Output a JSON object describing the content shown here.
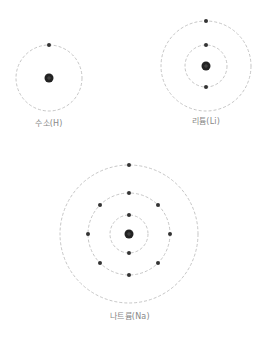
{
  "colors": {
    "orbit": "#b8b8b8",
    "electron": "#333333",
    "nucleus": "#222222",
    "label": "#888888"
  },
  "atoms": [
    {
      "name": "hydrogen",
      "label": "수소(H)",
      "center": [
        49,
        78
      ],
      "shells": [
        {
          "radius": 33,
          "electrons": [
            270
          ]
        }
      ],
      "label_pos": [
        49,
        123
      ]
    },
    {
      "name": "lithium",
      "label": "리튬(Li)",
      "center": [
        206,
        66
      ],
      "shells": [
        {
          "radius": 21,
          "electrons": [
            270,
            90
          ]
        },
        {
          "radius": 45,
          "electrons": [
            270
          ]
        }
      ],
      "label_pos": [
        206,
        121
      ]
    },
    {
      "name": "sodium",
      "label": "나트륨(Na)",
      "center": [
        129,
        234
      ],
      "shells": [
        {
          "radius": 19,
          "electrons": [
            270,
            90
          ]
        },
        {
          "radius": 41,
          "electrons": [
            270,
            315,
            0,
            45,
            90,
            135,
            180,
            225
          ]
        },
        {
          "radius": 69,
          "electrons": [
            270
          ]
        }
      ],
      "label_pos": [
        130,
        316
      ]
    }
  ]
}
